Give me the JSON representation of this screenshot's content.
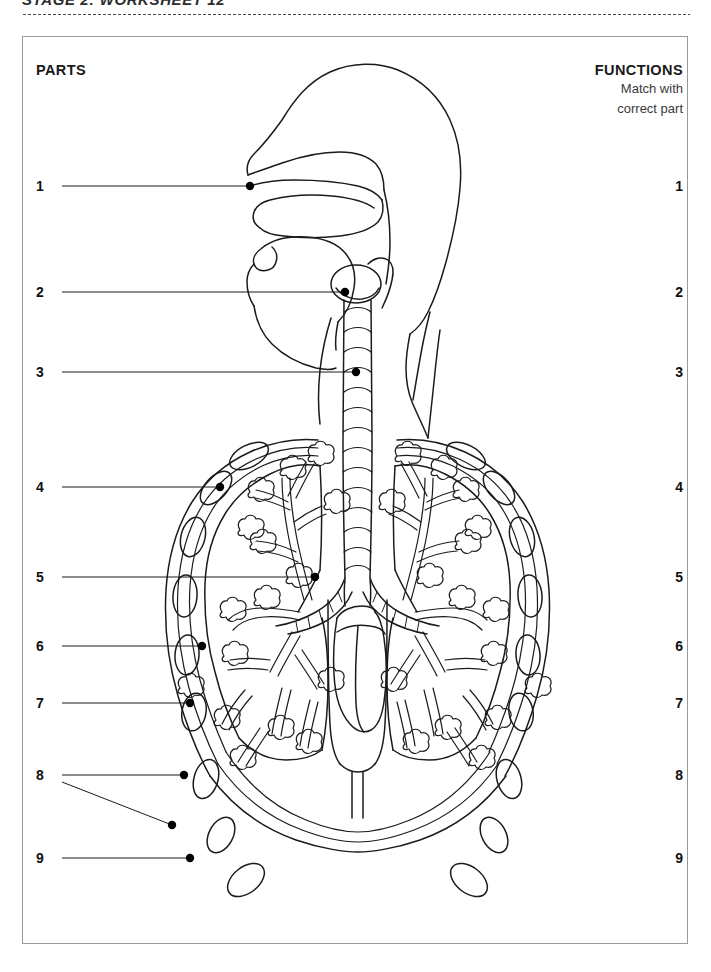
{
  "page": {
    "title": "STAGE 2: WORKSHEET 12",
    "background_color": "#ffffff",
    "ink_color": "#1b1b1b",
    "frame_border_color": "#9a9a9a"
  },
  "headers": {
    "parts": "PARTS",
    "functions": "FUNCTIONS",
    "functions_sub_line1": "Match with",
    "functions_sub_line2": "correct part"
  },
  "parts_column": {
    "items": [
      {
        "number": "1",
        "y": 186
      },
      {
        "number": "2",
        "y": 292
      },
      {
        "number": "3",
        "y": 372
      },
      {
        "number": "4",
        "y": 487
      },
      {
        "number": "5",
        "y": 577
      },
      {
        "number": "6",
        "y": 646
      },
      {
        "number": "7",
        "y": 703
      },
      {
        "number": "8",
        "y": 775
      },
      {
        "number": "9",
        "y": 858
      }
    ]
  },
  "functions_column": {
    "items": [
      {
        "number": "1",
        "y": 186
      },
      {
        "number": "2",
        "y": 292
      },
      {
        "number": "3",
        "y": 372
      },
      {
        "number": "4",
        "y": 487
      },
      {
        "number": "5",
        "y": 577
      },
      {
        "number": "6",
        "y": 646
      },
      {
        "number": "7",
        "y": 703
      },
      {
        "number": "8",
        "y": 775
      },
      {
        "number": "9",
        "y": 858
      }
    ]
  },
  "diagram": {
    "name": "respiratory-system-diagram",
    "leader_lines": [
      {
        "number": "1",
        "from_x": 62,
        "from_y": 186,
        "to_x": 250,
        "to_y": 186
      },
      {
        "number": "2",
        "from_x": 62,
        "from_y": 292,
        "to_x": 345,
        "to_y": 292
      },
      {
        "number": "3",
        "from_x": 62,
        "from_y": 372,
        "to_x": 356,
        "to_y": 372
      },
      {
        "number": "4",
        "from_x": 62,
        "from_y": 487,
        "to_x": 220,
        "to_y": 487
      },
      {
        "number": "5",
        "from_x": 62,
        "from_y": 577,
        "to_x": 315,
        "to_y": 577
      },
      {
        "number": "6",
        "from_x": 62,
        "from_y": 646,
        "to_x": 202,
        "to_y": 646
      },
      {
        "number": "7",
        "from_x": 62,
        "from_y": 703,
        "to_x": 190,
        "to_y": 703
      },
      {
        "number": "8",
        "from_x": 62,
        "from_y": 775,
        "to_x": 184,
        "to_y": 775,
        "branch_x": 172,
        "branch_y": 825
      },
      {
        "number": "9",
        "from_x": 62,
        "from_y": 858,
        "to_x": 190,
        "to_y": 858
      }
    ]
  }
}
